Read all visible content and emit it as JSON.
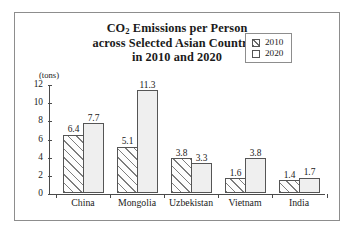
{
  "figure": {
    "title_lines": [
      "CO2 Emissions per Person",
      "across Selected Asian Countries",
      "in 2010 and 2020"
    ],
    "title_line1_pre": "CO",
    "title_line1_sub": "2",
    "title_line1_post": " Emissions per Person",
    "border_color": "#8d8d8d"
  },
  "legend": {
    "position": "top-right-inside",
    "items": [
      {
        "label": "2010",
        "swatch": "diagonal-hatch"
      },
      {
        "label": "2020",
        "swatch": "plain-white"
      }
    ]
  },
  "axis": {
    "unit_label": "(tons)",
    "y_ticks": [
      "0",
      "2",
      "4",
      "6",
      "8",
      "10",
      "12"
    ],
    "x_labels": [
      "China",
      "Mongolia",
      "Uzbekistan",
      "Vietnam",
      "India"
    ]
  },
  "chart_data": {
    "type": "bar",
    "title": "CO2 Emissions per Person across Selected Asian Countries in 2010 and 2020",
    "xlabel": "",
    "ylabel": "(tons)",
    "ylim": [
      0,
      12
    ],
    "yticks": [
      0,
      2,
      4,
      6,
      8,
      10,
      12
    ],
    "grid": false,
    "legend_position": "upper right",
    "categories": [
      "China",
      "Mongolia",
      "Uzbekistan",
      "Vietnam",
      "India"
    ],
    "series": [
      {
        "name": "2010",
        "values": [
          6.4,
          5.1,
          3.8,
          1.6,
          1.4
        ],
        "style": "diagonal-hatch"
      },
      {
        "name": "2020",
        "values": [
          7.7,
          11.3,
          3.3,
          3.8,
          1.7
        ],
        "style": "plain-white"
      }
    ],
    "bar_labels": {
      "China": [
        "6.4",
        "7.7"
      ],
      "Mongolia": [
        "5.1",
        "11.3"
      ],
      "Uzbekistan": [
        "3.8",
        "3.3"
      ],
      "Vietnam": [
        "1.6",
        "3.8"
      ],
      "India": [
        "1.4",
        "1.7"
      ]
    }
  }
}
